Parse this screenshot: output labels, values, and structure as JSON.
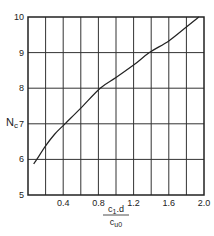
{
  "chart_data": {
    "type": "line",
    "title": "",
    "xlabel": "c1.d / cu0",
    "xlabel_numerator": "c",
    "xlabel_numerator_sub": "1",
    "xlabel_numerator_rest": ".d",
    "xlabel_denominator": "c",
    "xlabel_denominator_sub": "u0",
    "ylabel": "Nc",
    "ylabel_main": "N",
    "ylabel_sub": "c",
    "xlim": [
      0,
      2.0
    ],
    "ylim": [
      5,
      10
    ],
    "grid": true,
    "x_grid_step": 0.2,
    "y_grid_step": 1,
    "x_ticks": [
      "0.4",
      "0.8",
      "1.2",
      "1.6",
      "2.0"
    ],
    "x_tick_values": [
      0.4,
      0.8,
      1.2,
      1.6,
      2.0
    ],
    "y_ticks": [
      "5",
      "6",
      "7",
      "8",
      "9",
      "10"
    ],
    "y_tick_values": [
      5,
      6,
      7,
      8,
      9,
      10
    ],
    "series": [
      {
        "name": "Nc",
        "x": [
          0.065,
          0.1,
          0.2,
          0.3,
          0.42,
          0.6,
          0.82,
          1.0,
          1.2,
          1.38,
          1.6,
          1.8,
          1.94
        ],
        "y": [
          5.87,
          6.0,
          6.38,
          6.7,
          7.0,
          7.44,
          8.0,
          8.3,
          8.65,
          9.0,
          9.33,
          9.72,
          10.0
        ]
      }
    ]
  }
}
